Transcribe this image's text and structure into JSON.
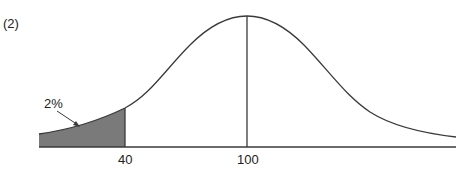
{
  "figure": {
    "number_label": "(2)",
    "type": "normal distribution curve",
    "annotation": "2%",
    "x_ticks": [
      {
        "value": "40",
        "label": "40"
      },
      {
        "value": "100",
        "label": "100"
      }
    ],
    "shaded_region": {
      "from": "left tail",
      "to": "40",
      "percent": "2%"
    },
    "mean_marker": "100",
    "colors": {
      "curve": "#3a3a3a",
      "shade": "#7a7a7a",
      "axis": "#3a3a3a",
      "background": "#ffffff"
    }
  }
}
